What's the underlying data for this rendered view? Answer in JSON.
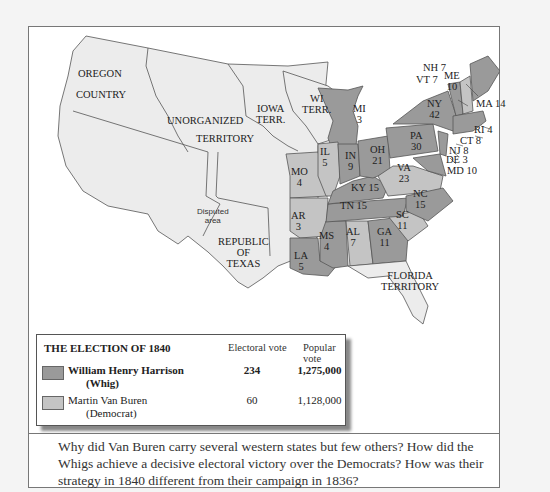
{
  "map": {
    "title": "THE ELECTION OF 1840",
    "colors": {
      "whig": "#9a9a9a",
      "democrat": "#c4c4c4",
      "territory": "#ececec",
      "outline": "#555555"
    },
    "territories": [
      {
        "id": "oregon",
        "label": "OREGON\nCOUNTRY",
        "line1": "OREGON",
        "line2": "COUNTRY"
      },
      {
        "id": "unorganized",
        "line1": "UNORGANIZED",
        "line2": "TERRITORY"
      },
      {
        "id": "iowa",
        "line1": "IOWA",
        "line2": "TERR."
      },
      {
        "id": "wisconsin",
        "line1": "WI",
        "line2": "TERR."
      },
      {
        "id": "disputed",
        "line1": "Disputed",
        "line2": "area"
      },
      {
        "id": "texas",
        "line1": "REPUBLIC",
        "line2": "OF",
        "line3": "TEXAS"
      },
      {
        "id": "florida",
        "line1": "FLORIDA",
        "line2": "TERRITORY"
      }
    ],
    "states": [
      {
        "abbr": "ME",
        "ev": "10",
        "winner": "whig"
      },
      {
        "abbr": "NH",
        "ev": "7",
        "winner": "democrat",
        "label": "NH 7"
      },
      {
        "abbr": "VT",
        "ev": "7",
        "winner": "whig",
        "label": "VT 7"
      },
      {
        "abbr": "MA",
        "ev": "14",
        "winner": "whig",
        "label": "MA 14"
      },
      {
        "abbr": "RI",
        "ev": "4",
        "winner": "whig",
        "label": "RI 4"
      },
      {
        "abbr": "CT",
        "ev": "8",
        "winner": "whig",
        "label": "CT 8"
      },
      {
        "abbr": "NY",
        "ev": "42",
        "winner": "whig"
      },
      {
        "abbr": "NJ",
        "ev": "8",
        "winner": "whig",
        "label": "NJ 8"
      },
      {
        "abbr": "PA",
        "ev": "30",
        "winner": "whig"
      },
      {
        "abbr": "DE",
        "ev": "3",
        "winner": "whig",
        "label": "DE 3"
      },
      {
        "abbr": "MD",
        "ev": "10",
        "winner": "whig",
        "label": "MD 10"
      },
      {
        "abbr": "VA",
        "ev": "23",
        "winner": "democrat"
      },
      {
        "abbr": "NC",
        "ev": "15",
        "winner": "whig"
      },
      {
        "abbr": "SC",
        "ev": "11",
        "winner": "democrat"
      },
      {
        "abbr": "GA",
        "ev": "11",
        "winner": "whig"
      },
      {
        "abbr": "AL",
        "ev": "7",
        "winner": "democrat"
      },
      {
        "abbr": "MS",
        "ev": "4",
        "winner": "whig"
      },
      {
        "abbr": "LA",
        "ev": "5",
        "winner": "whig"
      },
      {
        "abbr": "TN",
        "ev": "15",
        "winner": "whig",
        "label": "TN 15"
      },
      {
        "abbr": "KY",
        "ev": "15",
        "winner": "whig",
        "label": "KY 15"
      },
      {
        "abbr": "OH",
        "ev": "21",
        "winner": "whig"
      },
      {
        "abbr": "IN",
        "ev": "9",
        "winner": "whig"
      },
      {
        "abbr": "IL",
        "ev": "5",
        "winner": "democrat"
      },
      {
        "abbr": "MI",
        "ev": "3",
        "winner": "whig"
      },
      {
        "abbr": "MO",
        "ev": "4",
        "winner": "democrat"
      },
      {
        "abbr": "AR",
        "ev": "3",
        "winner": "democrat"
      }
    ]
  },
  "legend": {
    "title": "THE ELECTION OF 1840",
    "col_electoral": "Electoral vote",
    "col_popular": "Popular vote",
    "rows": [
      {
        "name": "William Henry Harrison",
        "party": "(Whig)",
        "electoral": "234",
        "popular": "1,275,000",
        "color": "#9a9a9a",
        "bold": true
      },
      {
        "name": "Martin Van Buren",
        "party": "(Democrat)",
        "electoral": "60",
        "popular": "1,128,000",
        "color": "#c4c4c4",
        "bold": false
      }
    ]
  },
  "caption": "Why did Van Buren carry several western states but few others? How did the Whigs achieve a decisive electoral victory over the Democrats? How was their strategy in 1840 different from their campaign in 1836?"
}
